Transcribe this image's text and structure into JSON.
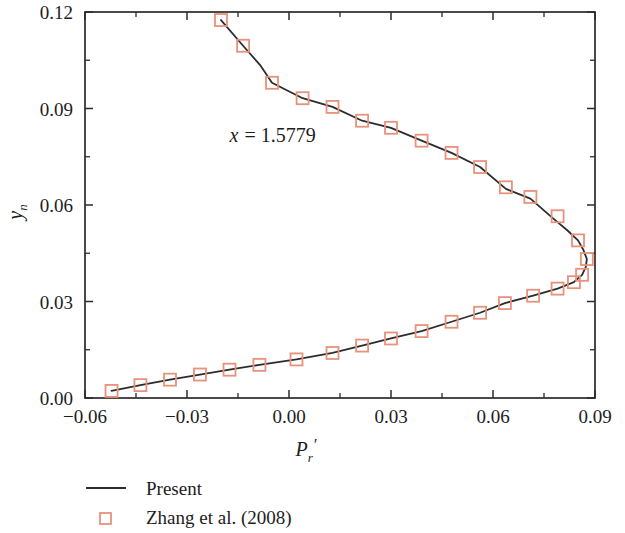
{
  "chart_data": {
    "type": "line",
    "title": "",
    "xlabel": "P_r'",
    "xlabel_base": "P",
    "xlabel_sub": "r",
    "xlabel_prime": "′",
    "ylabel": "y_n",
    "ylabel_base": "y",
    "ylabel_sub": "n",
    "xlim": [
      -0.06,
      0.09
    ],
    "ylim": [
      0.0,
      0.12
    ],
    "xticks": [
      -0.06,
      -0.03,
      0.0,
      0.03,
      0.06,
      0.09
    ],
    "xticklabels": [
      "−0.06",
      "−0.03",
      "0.00",
      "0.03",
      "0.06",
      "0.09"
    ],
    "yticks": [
      0.0,
      0.03,
      0.06,
      0.09,
      0.12
    ],
    "yticklabels": [
      "0.00",
      "0.03",
      "0.06",
      "0.09",
      "0.12"
    ],
    "x_minor_interval": 0.015,
    "y_minor_interval": 0.015,
    "grid": false,
    "legend_position": "below-left",
    "annotations": [
      {
        "text": "x = 1.5779",
        "var": "x",
        "eq": "= 1.5779",
        "x": -0.0175,
        "y": 0.0795
      }
    ],
    "series": [
      {
        "name": "Present",
        "kind": "line",
        "color": "#2e2b2b",
        "points": [
          [
            -0.0522,
            0.0022
          ],
          [
            -0.0437,
            0.004
          ],
          [
            -0.035,
            0.0057
          ],
          [
            -0.0262,
            0.0073
          ],
          [
            -0.0175,
            0.0088
          ],
          [
            -0.0087,
            0.0103
          ],
          [
            0.0022,
            0.012
          ],
          [
            0.0128,
            0.014
          ],
          [
            0.0215,
            0.0163
          ],
          [
            0.03,
            0.0185
          ],
          [
            0.039,
            0.0208
          ],
          [
            0.0478,
            0.0237
          ],
          [
            0.0562,
            0.0265
          ],
          [
            0.0635,
            0.0295
          ],
          [
            0.0718,
            0.0318
          ],
          [
            0.079,
            0.034
          ],
          [
            0.0838,
            0.036
          ],
          [
            0.0862,
            0.0383
          ],
          [
            0.0873,
            0.0408
          ],
          [
            0.0876,
            0.0432
          ],
          [
            0.0866,
            0.046
          ],
          [
            0.085,
            0.049
          ],
          [
            0.082,
            0.052
          ],
          [
            0.0775,
            0.056
          ],
          [
            0.071,
            0.062
          ],
          [
            0.0638,
            0.065
          ],
          [
            0.0562,
            0.0718
          ],
          [
            0.0478,
            0.0762
          ],
          [
            0.039,
            0.08
          ],
          [
            0.03,
            0.084
          ],
          [
            0.0215,
            0.0862
          ],
          [
            0.0128,
            0.0905
          ],
          [
            0.004,
            0.0932
          ],
          [
            -0.005,
            0.098
          ],
          [
            -0.0085,
            0.1035
          ],
          [
            -0.0135,
            0.1095
          ],
          [
            -0.02,
            0.1175
          ]
        ]
      },
      {
        "name": "Zhang et al. (2008)",
        "kind": "marker",
        "marker": "open-square",
        "color": "#e8927c",
        "points": [
          [
            -0.0522,
            0.0022
          ],
          [
            -0.0437,
            0.004
          ],
          [
            -0.035,
            0.0057
          ],
          [
            -0.0262,
            0.0073
          ],
          [
            -0.0175,
            0.0088
          ],
          [
            -0.0087,
            0.0103
          ],
          [
            0.0022,
            0.012
          ],
          [
            0.0128,
            0.014
          ],
          [
            0.0215,
            0.0163
          ],
          [
            0.03,
            0.0185
          ],
          [
            0.039,
            0.0208
          ],
          [
            0.0478,
            0.0237
          ],
          [
            0.0562,
            0.0265
          ],
          [
            0.0635,
            0.0295
          ],
          [
            0.0718,
            0.0318
          ],
          [
            0.079,
            0.034
          ],
          [
            0.0838,
            0.036
          ],
          [
            0.0862,
            0.0383
          ],
          [
            0.0876,
            0.0432
          ],
          [
            0.085,
            0.049
          ],
          [
            0.079,
            0.0565
          ],
          [
            0.071,
            0.0625
          ],
          [
            0.0638,
            0.0655
          ],
          [
            0.0562,
            0.0718
          ],
          [
            0.0478,
            0.0762
          ],
          [
            0.039,
            0.08
          ],
          [
            0.03,
            0.084
          ],
          [
            0.0215,
            0.0862
          ],
          [
            0.0128,
            0.0905
          ],
          [
            0.004,
            0.0932
          ],
          [
            -0.005,
            0.098
          ],
          [
            -0.0135,
            0.1095
          ],
          [
            -0.02,
            0.1175
          ]
        ]
      }
    ]
  },
  "legend": {
    "items": [
      {
        "label": "Present",
        "type": "line",
        "color": "#2e2b2b"
      },
      {
        "label": "Zhang et al. (2008)",
        "type": "open-square",
        "color": "#e8927c"
      }
    ]
  },
  "colors": {
    "marker": "#e8927c",
    "line": "#2e2b2b",
    "axis": "#2b2b2b",
    "text": "#1d1d1d",
    "background": "#ffffff"
  }
}
